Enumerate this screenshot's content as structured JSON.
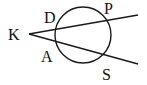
{
  "diagram": {
    "type": "geometry",
    "points": {
      "K": {
        "label": "K",
        "x": 29,
        "y": 34
      },
      "D": {
        "label": "D",
        "x": 56,
        "y": 30
      },
      "P": {
        "label": "P",
        "x": 106,
        "y": 21
      },
      "A": {
        "label": "A",
        "x": 55,
        "y": 42
      },
      "S": {
        "label": "S",
        "x": 106,
        "y": 54
      }
    },
    "circle": {
      "cx": 83,
      "cy": 35,
      "r": 28
    },
    "segments": [
      {
        "from": "K",
        "to": "P",
        "end": [
          138,
          15
        ]
      },
      {
        "from": "K",
        "to": "S",
        "end": [
          138,
          64
        ]
      }
    ],
    "colors": {
      "stroke": "#1a1a1a",
      "background": "#ffffff"
    }
  }
}
